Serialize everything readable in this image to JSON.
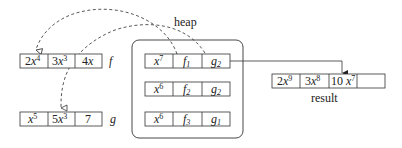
{
  "heap": {
    "label": "heap",
    "rows": [
      {
        "coef": "x",
        "exp": "7",
        "f": "f",
        "f_sub": "1",
        "g": "g",
        "g_sub": "2"
      },
      {
        "coef": "x",
        "exp": "6",
        "f": "f",
        "f_sub": "2",
        "g": "g",
        "g_sub": "2"
      },
      {
        "coef": "x",
        "exp": "6",
        "f": "f",
        "f_sub": "3",
        "g": "g",
        "g_sub": "1"
      }
    ]
  },
  "f_array": {
    "label": "f",
    "cells": [
      {
        "coef": "2",
        "var": "x",
        "exp": "4"
      },
      {
        "coef": "3",
        "var": "x",
        "exp": "3"
      },
      {
        "coef": "4",
        "var": "x",
        "exp": ""
      }
    ]
  },
  "g_array": {
    "label": "g",
    "cells": [
      {
        "coef": "",
        "var": "x",
        "exp": "5"
      },
      {
        "coef": "5",
        "var": "x",
        "exp": "3"
      },
      {
        "coef": "7",
        "var": "",
        "exp": ""
      }
    ]
  },
  "result_array": {
    "label": "result",
    "cells": [
      {
        "coef": "2",
        "var": "x",
        "exp": "9"
      },
      {
        "coef": "3",
        "var": "x",
        "exp": "8"
      },
      {
        "coef": "10 ",
        "var": "x",
        "exp": "7"
      },
      {
        "coef": "",
        "var": "",
        "exp": ""
      }
    ]
  }
}
